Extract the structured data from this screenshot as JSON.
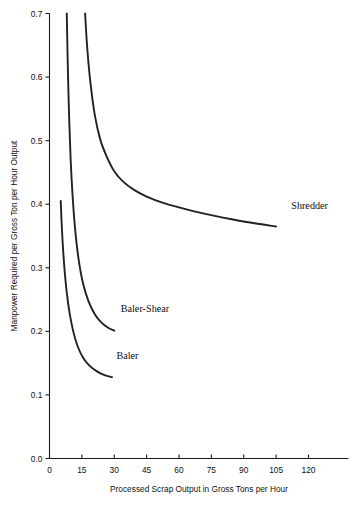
{
  "chart_data": {
    "type": "line",
    "title": "",
    "xlabel": "Processed Scrap Output in Gross Tons per Hour",
    "ylabel": "Manpower Required per Gross Ton per Hour Output",
    "xlim": [
      0,
      129
    ],
    "ylim": [
      0.0,
      0.7
    ],
    "grid": false,
    "legend_position": "inline-annotations",
    "xticks": [
      "0",
      "15",
      "30",
      "45",
      "60",
      "75",
      "90",
      "105",
      "120"
    ],
    "xtick_values": [
      0,
      15,
      30,
      45,
      60,
      75,
      90,
      105,
      120
    ],
    "yticks": [
      "0.0",
      "0.1",
      "0.2",
      "0.3",
      "0.4",
      "0.5",
      "0.6",
      "0.7"
    ],
    "ytick_values": [
      0.0,
      0.1,
      0.2,
      0.3,
      0.4,
      0.5,
      0.6,
      0.7
    ],
    "series": [
      {
        "name": "Shredder",
        "label": "Shredder",
        "label_x": 112,
        "label_y": 0.393,
        "x": [
          16.5,
          17.5,
          19,
          21,
          23.5,
          26.5,
          30,
          34,
          39,
          45,
          52,
          60,
          68,
          76,
          85,
          95,
          105
        ],
        "y": [
          0.7,
          0.645,
          0.59,
          0.54,
          0.502,
          0.475,
          0.452,
          0.436,
          0.423,
          0.412,
          0.403,
          0.395,
          0.388,
          0.382,
          0.376,
          0.37,
          0.365
        ]
      },
      {
        "name": "Baler-Shear",
        "label": "Baler-Shear",
        "label_x": 33,
        "label_y": 0.231,
        "x": [
          8.0,
          8.4,
          9.0,
          9.8,
          10.8,
          12.0,
          13.5,
          15.5,
          18.0,
          21.0,
          24.0,
          27.0,
          30.0
        ],
        "y": [
          0.7,
          0.63,
          0.548,
          0.47,
          0.408,
          0.356,
          0.313,
          0.276,
          0.248,
          0.227,
          0.214,
          0.206,
          0.201
        ]
      },
      {
        "name": "Baler",
        "label": "Baler",
        "label_x": 31,
        "label_y": 0.157,
        "x": [
          5.2,
          5.6,
          6.2,
          7.0,
          8.0,
          9.3,
          11.0,
          13.0,
          15.5,
          18.5,
          22.0,
          25.5,
          29.0
        ],
        "y": [
          0.405,
          0.372,
          0.334,
          0.296,
          0.261,
          0.229,
          0.2,
          0.177,
          0.159,
          0.146,
          0.137,
          0.131,
          0.128
        ]
      }
    ]
  },
  "axes": {
    "x_title": "Processed Scrap Output in Gross Tons per Hour",
    "y_title": "Manpower Required per Gross Ton per Hour Output"
  },
  "colors": {
    "curve": "#222222",
    "axis": "#1a1a1a",
    "text": "#111111",
    "background": "#ffffff"
  }
}
